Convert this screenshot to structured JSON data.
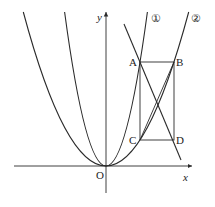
{
  "diagram": {
    "axes": {
      "x_label": "x",
      "y_label": "y",
      "origin_label": "O"
    },
    "points": {
      "A": "A",
      "B": "B",
      "C": "C",
      "D": "D"
    },
    "curve_labels": {
      "curve1": "①",
      "curve2": "②"
    },
    "colors": {
      "stroke": "#2a2a2a",
      "background": "#ffffff"
    }
  }
}
